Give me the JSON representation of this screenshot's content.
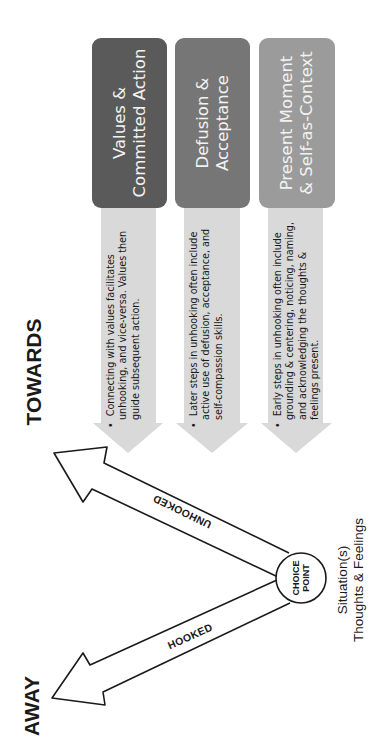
{
  "columns": [
    {
      "title_line1": "Values &",
      "title_line2": "Committed Action",
      "box_color": "#5a5a5a",
      "description": "Connecting with values facilitates unhooking, and vice-versa. Values then guide subsequent action."
    },
    {
      "title_line1": "Defusion &",
      "title_line2": "Acceptance",
      "box_color": "#767676",
      "description": "Later steps in unhooking often include active use of defusion, acceptance, and self-compassion skills."
    },
    {
      "title_line1": "Present Moment",
      "title_line2": "& Self-as-Context",
      "box_color": "#9b9b9b",
      "description": "Early steps in unhooking often include grounding & centering, noticing, naming, and acknowledging the thoughts & feelings present."
    }
  ],
  "arrow_fill": "#d9d9d9",
  "diagram": {
    "towards_label": "TOWARDS",
    "away_label": "AWAY",
    "unhooked_label": "UNHOOKED",
    "hooked_label": "HOOKED",
    "choice_point_line1": "CHOICE",
    "choice_point_line2": "POINT",
    "situation_line1": "Situation(s)",
    "situation_line2": "Thoughts & Feelings"
  },
  "bullet": "•"
}
